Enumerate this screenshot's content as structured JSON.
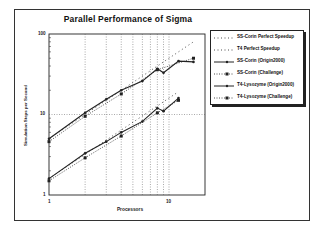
{
  "chart_data": {
    "type": "line",
    "title": "Parallel Performance of Sigma",
    "xlabel": "Processors",
    "ylabel": "Simulation Steps per Second",
    "xscale": "log",
    "yscale": "log",
    "xlim": [
      1,
      20
    ],
    "ylim": [
      1,
      100
    ],
    "x_tick_labels": [
      "1",
      "10"
    ],
    "y_tick_labels": [
      "1",
      "10",
      "100"
    ],
    "grid": true,
    "legend_position": "right",
    "series": [
      {
        "name": "SS-Corin Perfect Speedup",
        "style": "dotted",
        "marker": "none",
        "x": [
          1,
          2,
          4,
          8,
          16
        ],
        "y": [
          5,
          10,
          20,
          40,
          80
        ]
      },
      {
        "name": "T4 Perfect Speedup",
        "style": "dotted",
        "marker": "none",
        "x": [
          1,
          2,
          4,
          8,
          12
        ],
        "y": [
          1.6,
          3.2,
          6.4,
          12.8,
          19.2
        ]
      },
      {
        "name": "SS-Corin (Origin2000)",
        "style": "solid",
        "marker": "dot",
        "x": [
          1,
          2,
          3,
          4,
          6,
          8,
          9,
          12,
          16
        ],
        "y": [
          5,
          10.5,
          15.5,
          20,
          26,
          37,
          33,
          46,
          45
        ]
      },
      {
        "name": "SS-Corin (Challenge)",
        "style": "dotted",
        "marker": "square",
        "x": [
          1,
          2,
          4,
          8,
          16
        ],
        "y": [
          4.6,
          9.5,
          18,
          36,
          50
        ]
      },
      {
        "name": "T4-Lysozyme (Origin2000)",
        "style": "solid",
        "marker": "dot",
        "x": [
          1,
          2,
          3,
          4,
          6,
          8,
          9,
          12
        ],
        "y": [
          1.6,
          3.3,
          4.6,
          6,
          8.2,
          12,
          11,
          16
        ]
      },
      {
        "name": "T4-Lysozyme (Challenge)",
        "style": "dotted",
        "marker": "square",
        "x": [
          1,
          2,
          4,
          8,
          12
        ],
        "y": [
          1.5,
          2.9,
          5.4,
          10.5,
          15
        ]
      }
    ]
  },
  "legend": [
    {
      "label": "SS-Corin Perfect Speedup"
    },
    {
      "label": "T4 Perfect Speedup"
    },
    {
      "label": "SS-Corin (Origin2000)"
    },
    {
      "label": "SS-Corin (Challenge)"
    },
    {
      "label": "T4-Lysozyme (Origin2000)"
    },
    {
      "label": "T4-Lysozyme (Challenge)"
    }
  ],
  "colors": {
    "ink": "#222222",
    "grid": "#555555",
    "background": "#ffffff"
  }
}
